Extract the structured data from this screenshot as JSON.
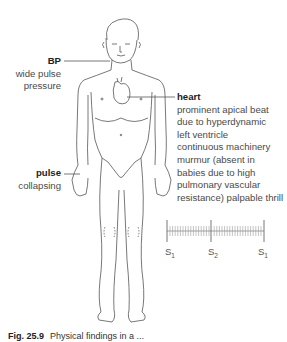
{
  "labels": {
    "bp": {
      "title": "BP",
      "lines": [
        "wide pulse",
        "pressure"
      ]
    },
    "pulse": {
      "title": "pulse",
      "lines": [
        "collapsing"
      ]
    },
    "heart": {
      "title": "heart",
      "lines": [
        "prominent apical beat",
        "due to hyperdynamic",
        "left ventricle",
        "continuous machinery",
        "murmur (absent in",
        "babies due to high",
        "pulmonary vascular",
        "resistance) palpable thrill"
      ]
    }
  },
  "phonocardiogram": {
    "sounds": [
      {
        "label": "S",
        "sub": "1"
      },
      {
        "label": "S",
        "sub": "2"
      },
      {
        "label": "S",
        "sub": "1"
      }
    ],
    "murmur": "continuous"
  },
  "caption": {
    "figure": "Fig. 25.9",
    "text": "Physical findings in a ..."
  },
  "colors": {
    "line": "#555555",
    "text": "#4a4a4a",
    "bold": "#222222"
  }
}
